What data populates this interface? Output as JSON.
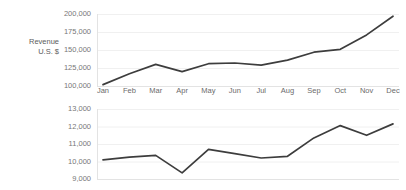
{
  "chart_data": [
    {
      "type": "line",
      "title": "",
      "series_label": "Revenue\nU.S. $",
      "xlabel": "",
      "ylabel": "Revenue U.S. $",
      "categories": [
        "Jan",
        "Feb",
        "Mar",
        "Apr",
        "May",
        "Jun",
        "Jul",
        "Aug",
        "Sep",
        "Oct",
        "Nov",
        "Dec"
      ],
      "values": [
        102000,
        117000,
        130000,
        120000,
        131000,
        132000,
        129000,
        136000,
        147000,
        151000,
        171000,
        197000
      ],
      "ytick_labels": [
        "200,000",
        "175,000",
        "150,000",
        "125,000",
        "100,000"
      ],
      "ytick_values": [
        200000,
        175000,
        150000,
        125000,
        100000
      ],
      "ylim": [
        100000,
        200000
      ],
      "grid": true,
      "legend": "none",
      "line_color": "#3d3d3d"
    },
    {
      "type": "line",
      "title": "",
      "series_label": "Orders",
      "xlabel": "",
      "ylabel": "Orders",
      "categories": [
        "Jan",
        "Feb",
        "Mar",
        "Apr",
        "May",
        "Jun",
        "Jul",
        "Aug",
        "Sep",
        "Oct",
        "Nov",
        "Dec"
      ],
      "values": [
        10100,
        10250,
        10350,
        9350,
        10700,
        10450,
        10200,
        10300,
        11350,
        12050,
        11500,
        12150
      ],
      "ytick_labels": [
        "13,000",
        "12,000",
        "11,000",
        "10,000",
        "9,000"
      ],
      "ytick_values": [
        13000,
        12000,
        11000,
        10000,
        9000
      ],
      "ylim": [
        9000,
        13000
      ],
      "grid": true,
      "legend": "none",
      "line_color": "#3d3d3d"
    }
  ],
  "revenue": {
    "label": "Revenue\nU.S. $",
    "yticks": [
      "200,000",
      "175,000",
      "150,000",
      "125,000",
      "100,000"
    ]
  },
  "orders": {
    "label": "Orders",
    "yticks": [
      "13,000",
      "12,000",
      "11,000",
      "10,000",
      "9,000"
    ]
  },
  "xaxis": {
    "months": [
      "Jan",
      "Feb",
      "Mar",
      "Apr",
      "May",
      "Jun",
      "Jul",
      "Aug",
      "Sep",
      "Oct",
      "Nov",
      "Dec"
    ]
  },
  "colors": {
    "line": "#3d3d3d",
    "axis": "#e3e3e3",
    "grid": "#f0f0f0",
    "tick_text": "#777777",
    "label_text": "#5c5c5c",
    "background": "#ffffff"
  }
}
